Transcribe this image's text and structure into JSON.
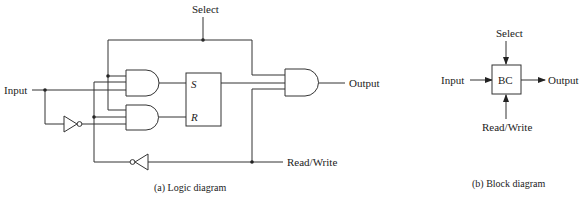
{
  "logic_diagram": {
    "labels": {
      "select": "Select",
      "input": "Input",
      "output": "Output",
      "read_write": "Read/Write",
      "s": "S",
      "r": "R"
    },
    "caption": "(a) Logic diagram",
    "components": [
      "and-gate-1",
      "and-gate-2",
      "inverter-input",
      "inverter-read-write",
      "sr-latch",
      "and-gate-output"
    ]
  },
  "block_diagram": {
    "labels": {
      "select": "Select",
      "input": "Input",
      "output": "Output",
      "read_write": "Read/Write",
      "block": "BC"
    },
    "caption": "(b) Block diagram"
  }
}
